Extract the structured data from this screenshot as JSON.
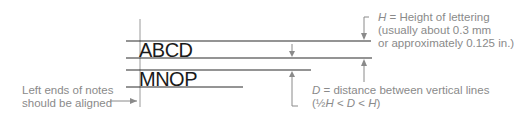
{
  "diagram": {
    "sample_lines": [
      "ABCD",
      "MNOP"
    ],
    "left_note": {
      "line1": "Left ends of notes",
      "line2": "should be aligned"
    },
    "h_note": {
      "symbol": "H",
      "eq": " = ",
      "text": "Height of lettering",
      "line2": "(usually about 0.3 mm",
      "line3": "or approximately 0.125 in.)"
    },
    "d_note": {
      "symbol": "D",
      "eq": " = ",
      "text": "distance between vertical lines",
      "line2_prefix": "(½",
      "line2_h1": "H",
      "line2_lt1": " < ",
      "line2_d": "D",
      "line2_lt2": " < ",
      "line2_h2": "H",
      "line2_suffix": ")"
    },
    "colors": {
      "guide_lines": "#2a2a2a",
      "annotation": "#8a8a8a",
      "alignment_line": "#9a9a9a",
      "lettering": "#1a1a1a"
    }
  }
}
